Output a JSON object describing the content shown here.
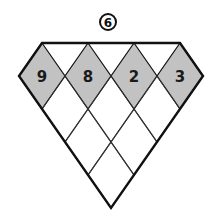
{
  "puzzle": {
    "badge_number": "6",
    "top_row": [
      "9",
      "8",
      "2",
      "3"
    ],
    "colors": {
      "shaded_fill": "#c2c2c2",
      "line": "#111111",
      "background": "#ffffff"
    },
    "empty_cells_rows": [
      3,
      2,
      1
    ]
  }
}
